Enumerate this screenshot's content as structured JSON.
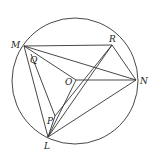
{
  "diagram": {
    "circle": {
      "cx": 75,
      "cy": 81,
      "r": 63
    },
    "points": {
      "M": {
        "x": 24,
        "y": 46,
        "label": "M",
        "lx": 11,
        "ly": 48
      },
      "R": {
        "x": 112,
        "y": 45,
        "label": "R",
        "lx": 109,
        "ly": 42
      },
      "N": {
        "x": 136,
        "y": 80,
        "label": "N",
        "lx": 140,
        "ly": 84
      },
      "O": {
        "x": 76,
        "y": 80,
        "label": "O",
        "lx": 65,
        "ly": 85
      },
      "Q": {
        "x": 31,
        "y": 54,
        "label": "Q",
        "lx": 30,
        "ly": 63
      },
      "P": {
        "x": 55,
        "y": 116,
        "label": "P",
        "lx": 47,
        "ly": 124
      },
      "L": {
        "x": 48,
        "y": 137,
        "label": "L",
        "lx": 44,
        "ly": 149
      }
    },
    "segments": [
      [
        "M",
        "R"
      ],
      [
        "M",
        "N"
      ],
      [
        "M",
        "O"
      ],
      [
        "M",
        "L"
      ],
      [
        "Q",
        "P"
      ],
      [
        "P",
        "L"
      ],
      [
        "O",
        "N"
      ],
      [
        "O",
        "L"
      ],
      [
        "R",
        "N"
      ],
      [
        "R",
        "L"
      ],
      [
        "R",
        "P"
      ],
      [
        "L",
        "N"
      ]
    ],
    "stroke": "#333333"
  }
}
